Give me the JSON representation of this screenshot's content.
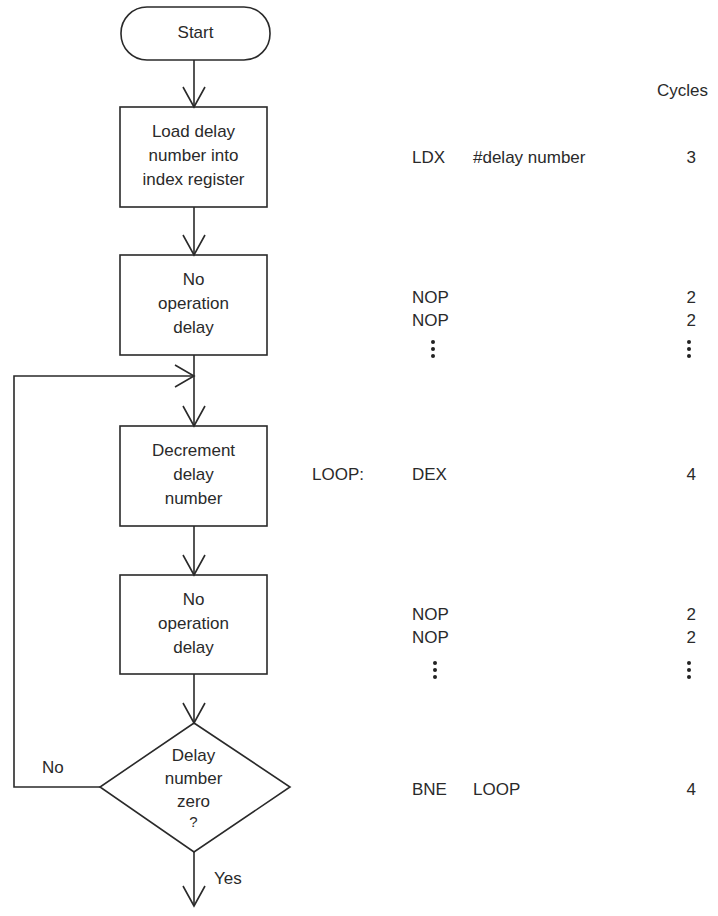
{
  "flowchart": {
    "nodes": [
      {
        "id": "start",
        "type": "terminal",
        "text": "Start"
      },
      {
        "id": "load",
        "type": "process",
        "lines": [
          "Load delay",
          "number into",
          "index register"
        ]
      },
      {
        "id": "nop1",
        "type": "process",
        "lines": [
          "No",
          "operation",
          "delay"
        ]
      },
      {
        "id": "dec",
        "type": "process",
        "lines": [
          "Decrement",
          "delay",
          "number"
        ]
      },
      {
        "id": "nop2",
        "type": "process",
        "lines": [
          "No",
          "operation",
          "delay"
        ]
      },
      {
        "id": "decision",
        "type": "decision",
        "lines": [
          "Delay",
          "number",
          "zero",
          "?"
        ]
      }
    ],
    "branch_labels": {
      "no": "No",
      "yes": "Yes"
    }
  },
  "code": {
    "cycles_header": "Cycles",
    "ldx": {
      "op": "LDX",
      "operand": "#delay number",
      "cycles": "3"
    },
    "nop_block1": [
      {
        "op": "NOP",
        "cycles": "2"
      },
      {
        "op": "NOP",
        "cycles": "2"
      }
    ],
    "dex": {
      "label": "LOOP:",
      "op": "DEX",
      "cycles": "4"
    },
    "nop_block2": [
      {
        "op": "NOP",
        "cycles": "2"
      },
      {
        "op": "NOP",
        "cycles": "2"
      }
    ],
    "bne": {
      "op": "BNE",
      "operand": "LOOP",
      "cycles": "4"
    }
  }
}
